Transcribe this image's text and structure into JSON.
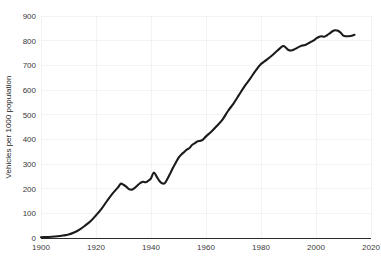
{
  "chart_data": {
    "type": "line",
    "title": "",
    "subtitle": "",
    "xlabel": "",
    "ylabel": "Vehicles per 1000 population",
    "xlim": [
      1900,
      2020
    ],
    "ylim": [
      0,
      900
    ],
    "grid": true,
    "legend": false,
    "legend_position": "none",
    "line_color": "#1b1b1b",
    "background_color": "#ffffff",
    "gridline_color": "#eeeef1",
    "x_ticks": [
      1900,
      1920,
      1940,
      1960,
      1980,
      2000,
      2020
    ],
    "x_tick_labels": [
      "1900",
      "1920",
      "1940",
      "1960",
      "1980",
      "2000",
      "2020"
    ],
    "y_ticks": [
      0,
      100,
      200,
      300,
      400,
      500,
      600,
      700,
      800,
      900
    ],
    "y_tick_labels": [
      "0",
      "100",
      "200",
      "300",
      "400",
      "500",
      "600",
      "700",
      "800",
      "900"
    ],
    "series": [
      {
        "name": "Vehicles per 1000 population",
        "x": [
          1900,
          1902,
          1904,
          1906,
          1908,
          1910,
          1912,
          1914,
          1916,
          1918,
          1920,
          1922,
          1924,
          1926,
          1928,
          1929,
          1930,
          1931,
          1932,
          1933,
          1934,
          1935,
          1936,
          1937,
          1938,
          1939,
          1940,
          1941,
          1942,
          1943,
          1944,
          1945,
          1946,
          1947,
          1948,
          1949,
          1950,
          1951,
          1952,
          1953,
          1954,
          1955,
          1956,
          1957,
          1958,
          1959,
          1960,
          1962,
          1964,
          1966,
          1968,
          1970,
          1972,
          1974,
          1976,
          1978,
          1980,
          1982,
          1984,
          1986,
          1988,
          1989,
          1990,
          1991,
          1992,
          1993,
          1994,
          1995,
          1996,
          1997,
          1998,
          1999,
          2000,
          2001,
          2002,
          2003,
          2004,
          2005,
          2006,
          2007,
          2008,
          2009,
          2010,
          2011,
          2012,
          2013,
          2014
        ],
        "y": [
          3,
          4,
          5,
          7,
          10,
          14,
          22,
          34,
          50,
          68,
          92,
          118,
          150,
          180,
          205,
          220,
          216,
          208,
          198,
          196,
          202,
          212,
          222,
          228,
          226,
          232,
          242,
          265,
          250,
          232,
          222,
          222,
          240,
          262,
          285,
          305,
          325,
          338,
          348,
          358,
          365,
          378,
          385,
          392,
          394,
          400,
          412,
          432,
          455,
          480,
          515,
          545,
          580,
          615,
          645,
          678,
          705,
          722,
          740,
          760,
          778,
          772,
          762,
          760,
          764,
          770,
          776,
          780,
          782,
          788,
          794,
          800,
          808,
          815,
          818,
          816,
          822,
          830,
          838,
          842,
          840,
          832,
          820,
          818,
          818,
          820,
          824
        ]
      }
    ]
  },
  "axes": {
    "y_axis_title": "Vehicles per 1000 population"
  }
}
